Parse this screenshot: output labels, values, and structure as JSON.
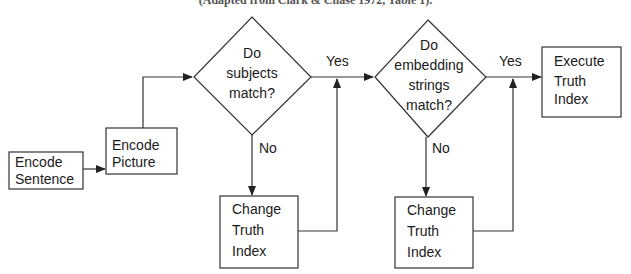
{
  "caption": "(Adapted from Clark & Chase 1972, Table 1).",
  "nodes": {
    "encode_sentence": {
      "line1": "Encode",
      "line2": "Sentence"
    },
    "encode_picture": {
      "line1": "Encode",
      "line2": "Picture"
    },
    "decision_subjects": {
      "line1": "Do",
      "line2": "subjects",
      "line3": "match?"
    },
    "decision_embedding": {
      "line1": "Do",
      "line2": "embedding",
      "line3": "strings",
      "line4": "match?"
    },
    "execute_truth_index": {
      "line1": "Execute",
      "line2": "Truth",
      "line3": "Index"
    },
    "change_truth_index_1": {
      "line1": "Change",
      "line2": "Truth",
      "line3": "Index"
    },
    "change_truth_index_2": {
      "line1": "Change",
      "line2": "Truth",
      "line3": "Index"
    }
  },
  "edges": {
    "yes_1": "Yes",
    "no_1": "No",
    "yes_2": "Yes",
    "no_2": "No"
  }
}
